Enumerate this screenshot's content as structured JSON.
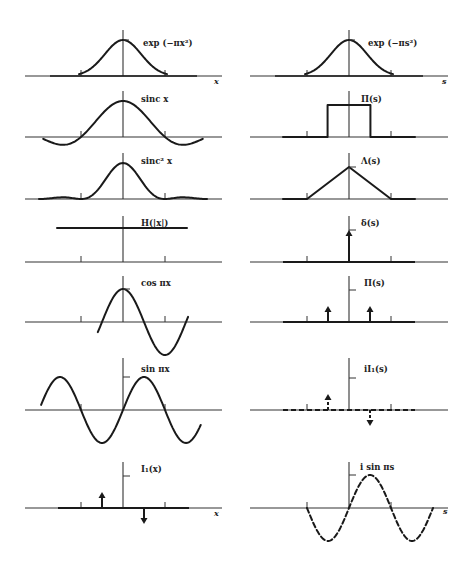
{
  "figure": {
    "left_axis_label": "x",
    "right_axis_label": "s",
    "pairs": [
      {
        "left": {
          "label": "exp (−πx²)",
          "kind": "gaussian"
        },
        "right": {
          "label": "exp (−πs²)",
          "kind": "gaussian"
        }
      },
      {
        "left": {
          "label": "sinc x",
          "kind": "sinc"
        },
        "right": {
          "label": "Π(s)",
          "kind": "rect"
        }
      },
      {
        "left": {
          "label": "sinc² x",
          "kind": "sinc2"
        },
        "right": {
          "label": "Λ(s)",
          "kind": "triangle"
        }
      },
      {
        "left": {
          "label": "H(|x|)",
          "kind": "constant"
        },
        "right": {
          "label": "δ(s)",
          "kind": "delta"
        }
      },
      {
        "left": {
          "label": "cos πx",
          "kind": "cos"
        },
        "right": {
          "label": "Π(s)",
          "kind": "even-impulse-pair"
        }
      },
      {
        "left": {
          "label": "sin πx",
          "kind": "sin"
        },
        "right": {
          "label": "iI₁(s)",
          "kind": "odd-impulse-pair-dashed"
        }
      },
      {
        "left": {
          "label": "I₁(x)",
          "kind": "odd-impulse-pair"
        },
        "right": {
          "label": "i sin πs",
          "kind": "sin-dashed"
        }
      }
    ]
  }
}
